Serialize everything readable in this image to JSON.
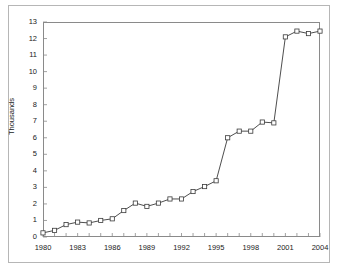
{
  "chart_data": {
    "type": "line",
    "title": "",
    "xlabel": "",
    "ylabel": "Thousands",
    "xlim": [
      1980,
      2004
    ],
    "ylim": [
      0,
      13
    ],
    "ytick_labels": [
      "13",
      "12",
      "11",
      "10",
      "9",
      "8",
      "7",
      "6",
      "5",
      "4",
      "3",
      "2",
      "1",
      "0"
    ],
    "ytick_values": [
      13,
      12,
      11,
      10,
      9,
      8,
      7,
      6,
      5,
      4,
      3,
      2,
      1,
      0
    ],
    "xtick_labels": [
      "1980",
      "1983",
      "1986",
      "1989",
      "1992",
      "1995",
      "1998",
      "2001",
      "2004"
    ],
    "xtick_values": [
      1980,
      1983,
      1986,
      1989,
      1992,
      1995,
      1998,
      2001,
      2004
    ],
    "x_minor_tick_step": 1,
    "grid": false,
    "legend": false,
    "marker": "open-square",
    "line_color": "#3a3a3a",
    "marker_color": "#3a3a3a",
    "x": [
      1980,
      1981,
      1982,
      1983,
      1984,
      1985,
      1986,
      1987,
      1988,
      1989,
      1990,
      1991,
      1992,
      1993,
      1994,
      1995,
      1996,
      1997,
      1998,
      1999,
      2000,
      2001,
      2002,
      2003,
      2004
    ],
    "values": [
      0.25,
      0.4,
      0.75,
      0.9,
      0.85,
      1.0,
      1.1,
      1.6,
      2.05,
      1.85,
      2.05,
      2.3,
      2.3,
      2.75,
      3.05,
      3.4,
      6.0,
      6.4,
      6.4,
      6.95,
      6.9,
      12.1,
      12.45,
      12.3,
      12.45
    ],
    "series": [
      {
        "name": "Series 1",
        "values": [
          0.25,
          0.4,
          0.75,
          0.9,
          0.85,
          1.0,
          1.1,
          1.6,
          2.05,
          1.85,
          2.05,
          2.3,
          2.3,
          2.75,
          3.05,
          3.4,
          6.0,
          6.4,
          6.4,
          6.95,
          6.9,
          12.1,
          12.45,
          12.3,
          12.45
        ]
      }
    ]
  },
  "figure": {
    "title_sliver": "",
    "y_axis_title": "Thousands"
  }
}
